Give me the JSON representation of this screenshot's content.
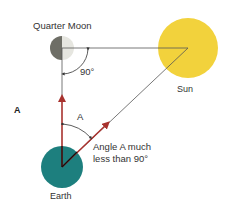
{
  "panel_label": "A",
  "labels": {
    "moon": "Quarter Moon",
    "sun": "Sun",
    "earth": "Earth",
    "right_angle": "90°",
    "angle_a": "A",
    "note_line1": "Angle A much",
    "note_line2": "less than 90°"
  },
  "colors": {
    "sun": "#f2d23c",
    "earth": "#1d7f7e",
    "moon_dark": "#6e6e66",
    "moon_light": "#e6e6e0",
    "arrow": "#a8322e",
    "line": "#555555"
  }
}
